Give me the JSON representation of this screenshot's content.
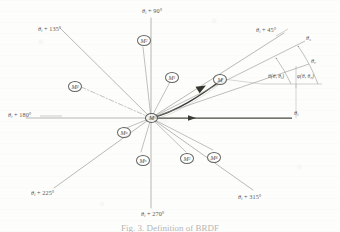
{
  "figure": {
    "caption": "Fig. 3.  Definition of BRDF",
    "origin_label": "M",
    "center": {
      "x": 151,
      "y": 118
    }
  },
  "colors": {
    "ray": "#8a8a84",
    "ray_main": "#5f5f5a",
    "ray_bold": "#3a3a37",
    "arc": "#9a9a93",
    "text": "#4b4b48",
    "paper": "#fdfdfc",
    "node_stroke": "#5a5a56"
  },
  "axis_labels": [
    {
      "name": "theta-i-plus-45",
      "text": "θ",
      "sub": "i",
      "suffix": " + 45°",
      "x": 256,
      "y": 31
    },
    {
      "name": "theta-i-plus-90",
      "text": "θ",
      "sub": "i",
      "suffix": " + 90°",
      "x": 146,
      "y": 10
    },
    {
      "name": "theta-i-plus-135",
      "text": "θ",
      "sub": "i",
      "suffix": " + 135°",
      "x": 41,
      "y": 29
    },
    {
      "name": "theta-i-plus-180",
      "text": "θ",
      "sub": "i",
      "suffix": " + 180°",
      "x": 11,
      "y": 112
    },
    {
      "name": "theta-i-plus-225",
      "text": "θ",
      "sub": "i",
      "suffix": " + 225°",
      "x": 34,
      "y": 192
    },
    {
      "name": "theta-i-plus-270",
      "text": "θ",
      "sub": "i",
      "suffix": " + 270°",
      "x": 144,
      "y": 213
    },
    {
      "name": "theta-i-plus-315",
      "text": "θ",
      "sub": "i",
      "suffix": " + 315°",
      "x": 241,
      "y": 196
    },
    {
      "name": "theta-i-axis",
      "text": "θ",
      "sub": "i",
      "suffix": "",
      "x": 294,
      "y": 111
    },
    {
      "name": "theta-s-axis",
      "text": "θ",
      "sub": "s",
      "suffix": "",
      "x": 307,
      "y": 38
    },
    {
      "name": "theta-r-axis",
      "text": "θ",
      "sub": "r",
      "suffix": "",
      "x": 312,
      "y": 61
    }
  ],
  "angle_annotations": [
    {
      "name": "angle-function-inner",
      "text": "θ(θ, θ",
      "sub": "i",
      "suffix": ")",
      "x": 277,
      "y": 76
    },
    {
      "name": "angle-function-outer",
      "text": "φ(θ, θ",
      "sub": "r",
      "suffix": ")",
      "x": 301,
      "y": 76
    }
  ],
  "nodes": [
    {
      "name": "node-m-origin",
      "label": "M",
      "sub": "",
      "x": 145,
      "y": 113
    },
    {
      "name": "node-m-main",
      "label": "M",
      "sub": "",
      "x": 213,
      "y": 74
    },
    {
      "name": "node-m-1",
      "label": "M",
      "sub": "1",
      "x": 165,
      "y": 72
    },
    {
      "name": "node-m-2",
      "label": "M",
      "sub": "2",
      "x": 137,
      "y": 35
    },
    {
      "name": "node-m-beta",
      "label": "M",
      "sub": "β",
      "x": 68,
      "y": 81
    },
    {
      "name": "node-m-alpha",
      "label": "M",
      "sub": "α",
      "x": 117,
      "y": 127
    },
    {
      "name": "node-m-n",
      "label": "M",
      "sub": "n",
      "x": 136,
      "y": 155
    },
    {
      "name": "node-m-3",
      "label": "M",
      "sub": "3",
      "x": 180,
      "y": 153
    },
    {
      "name": "node-m-4",
      "label": "M",
      "sub": "4",
      "x": 207,
      "y": 152
    }
  ],
  "rays": [
    {
      "name": "ray-45",
      "angle_deg": 45,
      "length": 128,
      "style": "thin"
    },
    {
      "name": "ray-90",
      "angle_deg": 90,
      "length": 108,
      "style": "thin"
    },
    {
      "name": "ray-135",
      "angle_deg": 135,
      "length": 128,
      "style": "thin"
    },
    {
      "name": "ray-180",
      "angle_deg": 180,
      "length": 130,
      "style": "thin"
    },
    {
      "name": "ray-225",
      "angle_deg": 225,
      "length": 128,
      "style": "thin"
    },
    {
      "name": "ray-270",
      "angle_deg": 270,
      "length": 104,
      "style": "thin"
    },
    {
      "name": "ray-315",
      "angle_deg": 315,
      "length": 128,
      "style": "thin"
    },
    {
      "name": "ray-0",
      "angle_deg": 0,
      "length": 145,
      "style": "bold-arrow"
    }
  ]
}
